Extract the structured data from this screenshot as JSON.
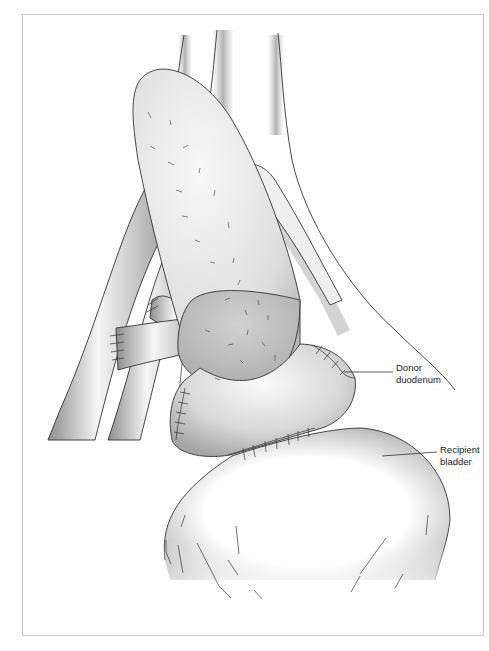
{
  "figure": {
    "type": "surgical illustration",
    "labels": [
      {
        "id": "donor-duodenum",
        "lines": [
          "Donor",
          "duodenum"
        ]
      },
      {
        "id": "recipient-bladder",
        "lines": [
          "Recipient",
          "bladder"
        ]
      }
    ]
  },
  "colors": {
    "frame_border": "#c8c8c8",
    "outline": "#333333",
    "shade_dark": "#9a9a9a",
    "shade_light": "#f4f4f4",
    "background": "#ffffff"
  }
}
